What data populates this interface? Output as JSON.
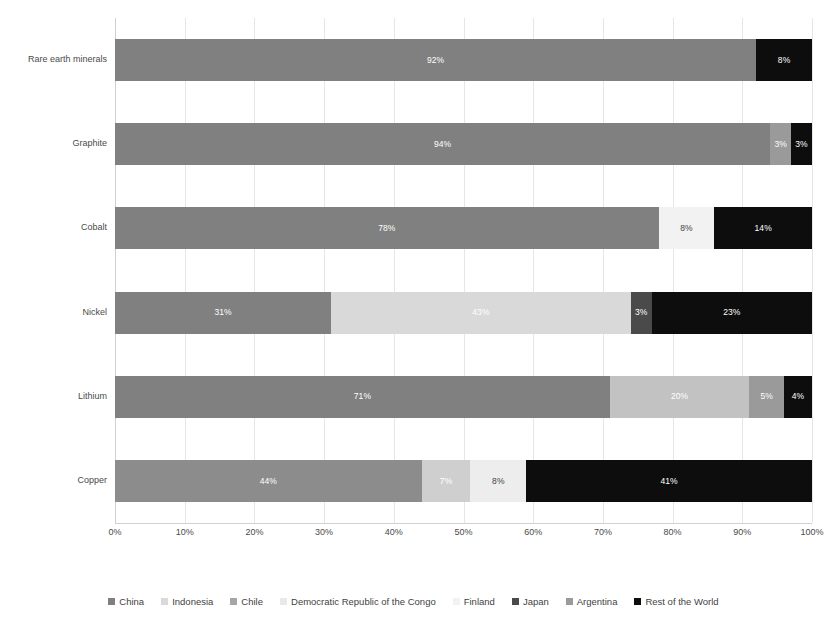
{
  "chart_data": {
    "type": "bar",
    "orientation": "horizontal",
    "stacked": true,
    "title": "",
    "subtitle": "",
    "xlabel": "",
    "ylabel": "",
    "xlim": [
      0,
      100
    ],
    "xtick_labels": [
      "0%",
      "10%",
      "20%",
      "30%",
      "40%",
      "50%",
      "60%",
      "70%",
      "80%",
      "90%",
      "100%"
    ],
    "xtick_values": [
      0,
      10,
      20,
      30,
      40,
      50,
      60,
      70,
      80,
      90,
      100
    ],
    "grid": true,
    "legend_position": "bottom",
    "categories": [
      "Copper",
      "Lithium",
      "Nickel",
      "Cobalt",
      "Graphite",
      "Rare earth minerals"
    ],
    "category_order_top_to_bottom": [
      "Rare earth minerals",
      "Graphite",
      "Cobalt",
      "Nickel",
      "Lithium",
      "Copper"
    ],
    "series": [
      {
        "name": "China",
        "color": "#808080",
        "pattern": "solid",
        "values": [
          44,
          71,
          31,
          78,
          94,
          92
        ]
      },
      {
        "name": "Indonesia",
        "color": "#d9d9d9",
        "pattern": "solid",
        "values": [
          0,
          0,
          43,
          0,
          0,
          0
        ]
      },
      {
        "name": "Chile",
        "color": "#a6a6a6",
        "pattern": "solid",
        "values": [
          7,
          20,
          0,
          0,
          0,
          0
        ]
      },
      {
        "name": "Democratic Republic of the Congo",
        "color": "#e8e8e8",
        "pattern": "hatch",
        "values": [
          8,
          0,
          0,
          0,
          0,
          0
        ]
      },
      {
        "name": "Finland",
        "color": "#f2f2f2",
        "pattern": "solid",
        "values": [
          0,
          0,
          0,
          8,
          0,
          0
        ]
      },
      {
        "name": "Japan",
        "color": "#4a4a4a",
        "pattern": "solid",
        "values": [
          0,
          0,
          3,
          0,
          0,
          0
        ]
      },
      {
        "name": "Argentina",
        "color": "#9a9a9a",
        "pattern": "solid",
        "values": [
          0,
          5,
          0,
          0,
          3,
          0
        ]
      },
      {
        "name": "Rest of the World",
        "color": "#0d0d0d",
        "pattern": "solid",
        "values": [
          41,
          4,
          23,
          14,
          3,
          8
        ]
      }
    ],
    "bars": [
      {
        "category": "Rare earth minerals",
        "segments": [
          {
            "series": "China",
            "value": 92,
            "label": "92%",
            "color": "#808080",
            "pattern": "solid",
            "label_color": "light"
          },
          {
            "series": "Rest of the World",
            "value": 8,
            "label": "8%",
            "color": "#0d0d0d",
            "pattern": "solid",
            "label_color": "light"
          }
        ]
      },
      {
        "category": "Graphite",
        "segments": [
          {
            "series": "China",
            "value": 94,
            "label": "94%",
            "color": "#808080",
            "pattern": "solid",
            "label_color": "light"
          },
          {
            "series": "Argentina",
            "value": 3,
            "label": "3%",
            "color": "#9a9a9a",
            "pattern": "solid",
            "label_color": "light"
          },
          {
            "series": "Rest of the World",
            "value": 3,
            "label": "3%",
            "color": "#0d0d0d",
            "pattern": "solid",
            "label_color": "light"
          }
        ]
      },
      {
        "category": "Cobalt",
        "segments": [
          {
            "series": "China",
            "value": 78,
            "label": "78%",
            "color": "#808080",
            "pattern": "solid",
            "label_color": "light"
          },
          {
            "series": "Finland",
            "value": 8,
            "label": "8%",
            "color": "#f2f2f2",
            "pattern": "solid",
            "label_color": "dark"
          },
          {
            "series": "Rest of the World",
            "value": 14,
            "label": "14%",
            "color": "#0d0d0d",
            "pattern": "solid",
            "label_color": "light"
          }
        ]
      },
      {
        "category": "Nickel",
        "segments": [
          {
            "series": "China",
            "value": 31,
            "label": "31%",
            "color": "#808080",
            "pattern": "solid",
            "label_color": "light"
          },
          {
            "series": "Indonesia",
            "value": 43,
            "label": "43%",
            "color": "#d9d9d9",
            "pattern": "solid",
            "label_color": "light"
          },
          {
            "series": "Japan",
            "value": 3,
            "label": "3%",
            "color": "#4a4a4a",
            "pattern": "solid",
            "label_color": "light"
          },
          {
            "series": "Rest of the World",
            "value": 23,
            "label": "23%",
            "color": "#0d0d0d",
            "pattern": "solid",
            "label_color": "light"
          }
        ]
      },
      {
        "category": "Lithium",
        "segments": [
          {
            "series": "China",
            "value": 71,
            "label": "71%",
            "color": "#808080",
            "pattern": "solid",
            "label_color": "light"
          },
          {
            "series": "Chile",
            "value": 20,
            "label": "20%",
            "color": "#c2c2c2",
            "pattern": "solid",
            "label_color": "light"
          },
          {
            "series": "Argentina",
            "value": 5,
            "label": "5%",
            "color": "#9a9a9a",
            "pattern": "solid",
            "label_color": "light"
          },
          {
            "series": "Rest of the World",
            "value": 4,
            "label": "4%",
            "color": "#0d0d0d",
            "pattern": "solid",
            "label_color": "light"
          }
        ]
      },
      {
        "category": "Copper",
        "segments": [
          {
            "series": "China",
            "value": 44,
            "label": "44%",
            "color": "#8c8c8c",
            "pattern": "solid",
            "label_color": "light"
          },
          {
            "series": "Chile",
            "value": 7,
            "label": "7%",
            "color": "#cfcfcf",
            "pattern": "solid",
            "label_color": "light"
          },
          {
            "series": "Democratic Republic of the Congo",
            "value": 8,
            "label": "8%",
            "color": "#ededed",
            "pattern": "hatch",
            "label_color": "dark"
          },
          {
            "series": "Rest of the World",
            "value": 41,
            "label": "41%",
            "color": "#0d0d0d",
            "pattern": "solid",
            "label_color": "light"
          }
        ]
      }
    ],
    "legend": [
      {
        "label": "China",
        "color": "#808080",
        "pattern": "solid"
      },
      {
        "label": "Indonesia",
        "color": "#d9d9d9",
        "pattern": "solid"
      },
      {
        "label": "Chile",
        "color": "#a6a6a6",
        "pattern": "solid"
      },
      {
        "label": "Democratic Republic of the Congo",
        "color": "#e8e8e8",
        "pattern": "hatch"
      },
      {
        "label": "Finland",
        "color": "#f2f2f2",
        "pattern": "solid"
      },
      {
        "label": "Japan",
        "color": "#4a4a4a",
        "pattern": "solid"
      },
      {
        "label": "Argentina",
        "color": "#9a9a9a",
        "pattern": "solid"
      },
      {
        "label": "Rest of the World",
        "color": "#0d0d0d",
        "pattern": "solid"
      }
    ]
  }
}
